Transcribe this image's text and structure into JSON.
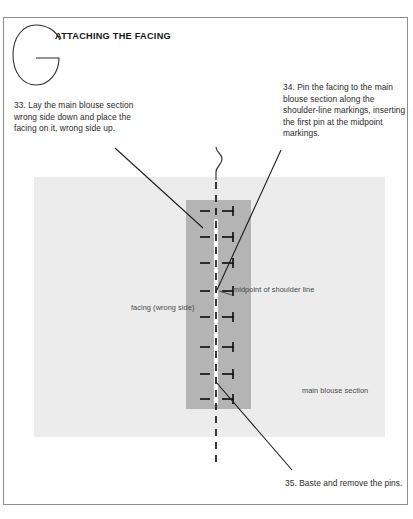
{
  "page": {
    "chapter_letter": "G",
    "section_title": "ATTACHING THE FACING"
  },
  "notes": {
    "step_33": "33. Lay the main blouse section wrong side down and place the facing on it, wrong side up.",
    "step_34": "34. Pin the facing to the main blouse section along the shoulder-line markings, inserting the first pin at the midpoint markings.",
    "step_35": "35. Baste and remove the pins."
  },
  "labels": {
    "facing": "facing (wrong side)",
    "midpoint": "midpoint of shoulder line",
    "main_blouse": "main blouse section"
  },
  "colors": {
    "page_background": "#ffffff",
    "frame_border": "#8e8e8e",
    "main_blouse_fill": "#ececec",
    "facing_fill": "#b4b4b4",
    "highlight_strip": "#fdfdfd",
    "ink": "#161616",
    "body_text": "#2a2a2a",
    "label_text": "#494949"
  },
  "illustration": {
    "pin_count": 8,
    "pin_positions_y": [
      211,
      237,
      263,
      291,
      317,
      347,
      374,
      399
    ],
    "center_line_x": 216,
    "dashed_line_top_y": 155,
    "dashed_line_bottom_y": 466
  }
}
